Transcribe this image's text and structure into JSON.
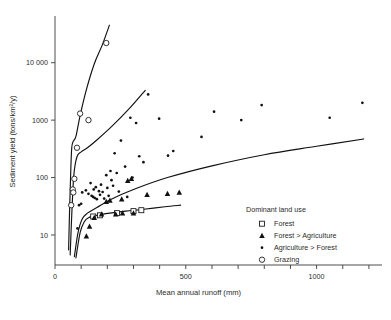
{
  "chart_data": {
    "type": "scatter",
    "title": "",
    "xlabel": "Mean annual runoff (mm)",
    "ylabel": "Sediment yield (tons/km²/y)",
    "xlim": [
      0,
      1250
    ],
    "ylim": [
      3,
      60000
    ],
    "yscale": "log",
    "xscale": "linear",
    "grid": false,
    "xticks": [
      0,
      100,
      200,
      300,
      400,
      500,
      600,
      700,
      800,
      900,
      1000,
      1100,
      1200
    ],
    "xticklabels": [
      "0",
      "",
      "",
      "",
      "",
      "500",
      "",
      "",
      "",
      "",
      "1000",
      "",
      ""
    ],
    "yticks": [
      10,
      100,
      1000,
      10000
    ],
    "yticklabels": [
      "10",
      "100",
      "1000",
      "10 000"
    ],
    "legend": {
      "title": "Dominant land use",
      "position": "lower-right",
      "entries": [
        {
          "label": "Forest",
          "marker": "open-square"
        },
        {
          "label": "Forest > Agriculture",
          "marker": "filled-triangle"
        },
        {
          "label": "Agriculture > Forest",
          "marker": "small-dot"
        },
        {
          "label": "Grazing",
          "marker": "open-circle"
        }
      ]
    },
    "series": [
      {
        "name": "Forest",
        "marker": "open-square",
        "points": [
          [
            146,
            21
          ],
          [
            172,
            22
          ],
          [
            237,
            24
          ],
          [
            300,
            26
          ],
          [
            330,
            27
          ]
        ]
      },
      {
        "name": "Forest > Agriculture",
        "marker": "filled-triangle",
        "points": [
          [
            120,
            9.5
          ],
          [
            132,
            14
          ],
          [
            150,
            20
          ],
          [
            178,
            23
          ],
          [
            196,
            38
          ],
          [
            210,
            40
          ],
          [
            232,
            23
          ],
          [
            255,
            42
          ],
          [
            258,
            24
          ],
          [
            278,
            88
          ],
          [
            292,
            95
          ],
          [
            300,
            24
          ],
          [
            352,
            50
          ],
          [
            430,
            52
          ],
          [
            475,
            55
          ]
        ]
      },
      {
        "name": "Agriculture > Forest",
        "marker": "small-dot",
        "points": [
          [
            86,
            13
          ],
          [
            92,
            33
          ],
          [
            100,
            35
          ],
          [
            104,
            55
          ],
          [
            118,
            60
          ],
          [
            128,
            52
          ],
          [
            136,
            80
          ],
          [
            140,
            48
          ],
          [
            146,
            46
          ],
          [
            148,
            62
          ],
          [
            152,
            44
          ],
          [
            156,
            68
          ],
          [
            160,
            42
          ],
          [
            168,
            58
          ],
          [
            172,
            50
          ],
          [
            176,
            75
          ],
          [
            182,
            56
          ],
          [
            188,
            43
          ],
          [
            196,
            110
          ],
          [
            200,
            66
          ],
          [
            205,
            48
          ],
          [
            212,
            130
          ],
          [
            216,
            90
          ],
          [
            222,
            72
          ],
          [
            228,
            265
          ],
          [
            236,
            120
          ],
          [
            244,
            57
          ],
          [
            252,
            440
          ],
          [
            268,
            155
          ],
          [
            276,
            46
          ],
          [
            288,
            1100
          ],
          [
            296,
            100
          ],
          [
            310,
            890
          ],
          [
            322,
            235
          ],
          [
            338,
            185
          ],
          [
            356,
            2800
          ],
          [
            398,
            1060
          ],
          [
            432,
            240
          ],
          [
            452,
            290
          ],
          [
            560,
            510
          ],
          [
            608,
            1400
          ],
          [
            712,
            1000
          ],
          [
            790,
            1830
          ],
          [
            1050,
            1100
          ],
          [
            1175,
            2000
          ]
        ]
      },
      {
        "name": "Grazing",
        "marker": "open-circle",
        "points": [
          [
            62,
            33
          ],
          [
            68,
            62
          ],
          [
            70,
            55
          ],
          [
            74,
            95
          ],
          [
            84,
            330
          ],
          [
            96,
            1300
          ],
          [
            128,
            1000
          ],
          [
            196,
            22000
          ]
        ]
      }
    ],
    "envelope_curves": [
      {
        "name": "grazing-envelope",
        "description": "Upper grazing envelope, steep rise then linear climb",
        "points": [
          [
            52,
            5.5
          ],
          [
            56,
            30
          ],
          [
            60,
            120
          ],
          [
            64,
            330
          ],
          [
            70,
            430
          ],
          [
            80,
            520
          ],
          [
            96,
            1200
          ],
          [
            120,
            3400
          ],
          [
            150,
            9500
          ],
          [
            180,
            20000
          ],
          [
            208,
            45000
          ]
        ]
      },
      {
        "name": "agriculture-forest-envelope",
        "description": "Second envelope curve rising to mid plot",
        "points": [
          [
            58,
            4.5
          ],
          [
            64,
            22
          ],
          [
            72,
            110
          ],
          [
            84,
            230
          ],
          [
            100,
            280
          ],
          [
            124,
            330
          ],
          [
            160,
            450
          ],
          [
            220,
            800
          ],
          [
            290,
            1700
          ],
          [
            345,
            3300
          ]
        ]
      },
      {
        "name": "mid-envelope",
        "description": "Long sloping envelope reaching right edge",
        "points": [
          [
            74,
            4.2
          ],
          [
            88,
            11
          ],
          [
            104,
            19
          ],
          [
            124,
            24
          ],
          [
            160,
            30
          ],
          [
            215,
            42
          ],
          [
            300,
            62
          ],
          [
            430,
            100
          ],
          [
            600,
            160
          ],
          [
            800,
            250
          ],
          [
            1000,
            350
          ],
          [
            1180,
            470
          ]
        ]
      },
      {
        "name": "forest-envelope",
        "description": "Lowest envelope flattening across forest points",
        "points": [
          [
            80,
            4.0
          ],
          [
            96,
            11
          ],
          [
            112,
            17
          ],
          [
            128,
            20
          ],
          [
            160,
            22
          ],
          [
            210,
            24
          ],
          [
            270,
            26
          ],
          [
            340,
            28
          ],
          [
            420,
            31
          ],
          [
            480,
            33
          ]
        ]
      }
    ]
  }
}
